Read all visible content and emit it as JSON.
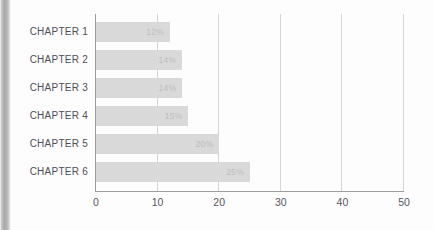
{
  "chart_data": {
    "type": "bar",
    "orientation": "horizontal",
    "title": "",
    "subtitle": "",
    "xlabel": "",
    "ylabel": "",
    "categories": [
      "CHAPTER 1",
      "CHAPTER 2",
      "CHAPTER 3",
      "CHAPTER 4",
      "CHAPTER 5",
      "CHAPTER 6"
    ],
    "values": [
      12,
      14,
      14,
      15,
      20,
      25
    ],
    "data_labels": [
      "12%",
      "14%",
      "14%",
      "15%",
      "20%",
      "25%"
    ],
    "xlim": [
      0,
      50
    ],
    "xticks": [
      0,
      10,
      20,
      30,
      40,
      50
    ],
    "xtick_labels": [
      "0",
      "10",
      "20",
      "30",
      "40",
      "50"
    ],
    "grid": true,
    "grid_axis": "x",
    "legend": null,
    "legend_position": "none",
    "colors": {
      "bar": "#d9d9d9",
      "bar_label": "#bdbdbd",
      "category_label": "#4d4d57",
      "tick_label": "#55555f",
      "gridline": "#d4d4d4",
      "axis": "#9e9e9e",
      "background": "#fdfdfd"
    }
  },
  "bars": [
    {
      "category": "CHAPTER 1",
      "value": 12,
      "label": "12%"
    },
    {
      "category": "CHAPTER 2",
      "value": 14,
      "label": "14%"
    },
    {
      "category": "CHAPTER 3",
      "value": 14,
      "label": "14%"
    },
    {
      "category": "CHAPTER 4",
      "value": 15,
      "label": "15%"
    },
    {
      "category": "CHAPTER 5",
      "value": 20,
      "label": "20%"
    },
    {
      "category": "CHAPTER 6",
      "value": 25,
      "label": "25%"
    }
  ],
  "axis": {
    "ticks": [
      {
        "value": 0,
        "label": "0"
      },
      {
        "value": 10,
        "label": "10"
      },
      {
        "value": 20,
        "label": "20"
      },
      {
        "value": 30,
        "label": "30"
      },
      {
        "value": 40,
        "label": "40"
      },
      {
        "value": 50,
        "label": "50"
      }
    ]
  }
}
